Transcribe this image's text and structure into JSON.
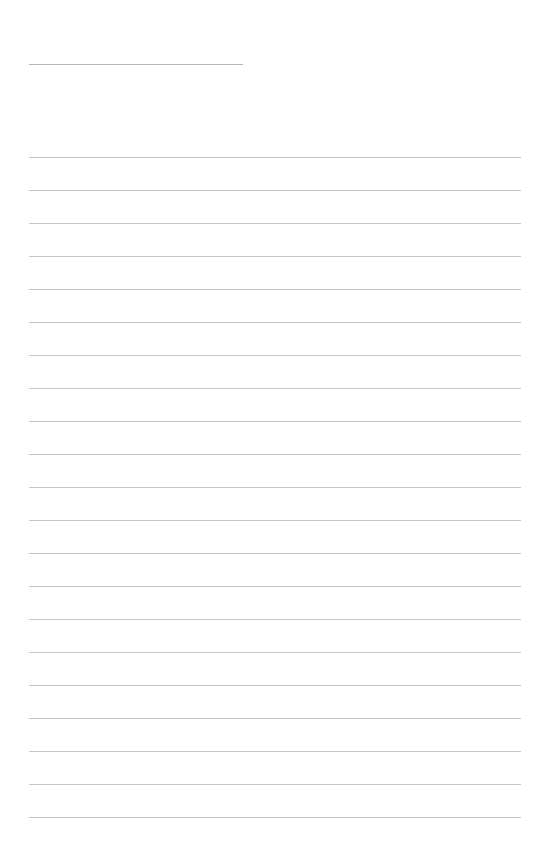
{
  "page": {
    "title_line": {
      "text": ""
    },
    "ruled_lines": {
      "count": 21,
      "first_y": 157,
      "spacing": 33,
      "values": [
        "",
        "",
        "",
        "",
        "",
        "",
        "",
        "",
        "",
        "",
        "",
        "",
        "",
        "",
        "",
        "",
        "",
        "",
        "",
        "",
        ""
      ]
    },
    "colors": {
      "background": "#ffffff",
      "rule": "#c4c4c4"
    }
  }
}
